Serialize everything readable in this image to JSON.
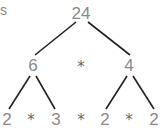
{
  "diagram": {
    "title_fragment": "s",
    "root": "24",
    "level1": {
      "left": "6",
      "op": "*",
      "right": "4"
    },
    "level2": [
      {
        "value": "2"
      },
      {
        "value": "*"
      },
      {
        "value": "3"
      },
      {
        "value": "*"
      },
      {
        "value": "2"
      },
      {
        "value": "*"
      },
      {
        "value": "2"
      }
    ],
    "colors": {
      "text": "#8a8a8a",
      "lines": "#222222"
    }
  }
}
